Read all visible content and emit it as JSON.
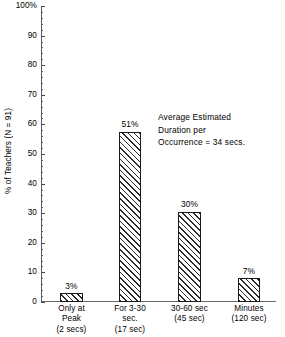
{
  "chart_data": {
    "type": "bar",
    "title": "",
    "xlabel": "",
    "ylabel": "% of Teachers (N = 91)",
    "ylim": [
      0,
      100
    ],
    "grid": false,
    "legend": "none",
    "categories": [
      "Only at Peak (2 secs)",
      "For 3-30 sec. (17 sec)",
      "30-60 sec (45 sec)",
      "Minutes (120 sec)"
    ],
    "values": [
      3,
      51,
      30,
      7
    ],
    "data_labels": [
      "3%",
      "51%",
      "30%",
      "7%"
    ],
    "y_tick_labels": [
      "100%",
      "90",
      "80",
      "70",
      "60",
      "50",
      "40",
      "30",
      "20",
      "10",
      "0"
    ],
    "y_tick_values": [
      100,
      90,
      80,
      70,
      60,
      50,
      40,
      30,
      20,
      10,
      0
    ],
    "y_minor_tick_step": 2,
    "x_tick_labels": [
      [
        "Only at",
        "Peak",
        "(2 secs)"
      ],
      [
        "For 3-30",
        "sec.",
        "(17 sec)"
      ],
      [
        "30-60 sec",
        "(45 sec)"
      ],
      [
        "Minutes",
        "(120 sec)"
      ]
    ],
    "annotations": [
      "Average Estimated",
      "Duration per",
      "Occurrence  =  34 secs."
    ],
    "bar_fill": "diagonal-hatch",
    "colors": {
      "bar_outline": "#1a1a1a",
      "bar_hatch": "#2b2b2b",
      "bar_background": "#ffffff",
      "axis": "#5a5a5a",
      "text": "#000000",
      "page_background": "#ffffff"
    },
    "bar_render_heights_percent": [
      3,
      57.5,
      30.5,
      8
    ]
  }
}
